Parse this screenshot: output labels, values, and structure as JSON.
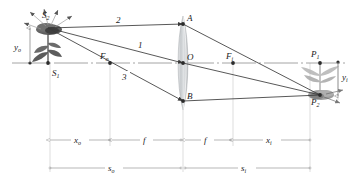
{
  "figure": {
    "type": "thin-lens-ray-diagram",
    "axis_y": 63,
    "lens_x": 183,
    "colors": {
      "line": "#3a3a3a",
      "axis": "#8d8d8d",
      "dimension": "#9a9a9a",
      "lens_glass": "#cfd2d4",
      "object": "#6f6f6f",
      "image": "#9a9a9a",
      "text": "#1a1a1a"
    }
  },
  "points": {
    "S1": {
      "label": "S",
      "sub": "1",
      "x": 48,
      "y": 63,
      "label_x": 52,
      "label_y": 75
    },
    "S2": {
      "label": "S",
      "sub": "2",
      "x": 48,
      "y": 28,
      "label_x": 44,
      "label_y": 17
    },
    "A": {
      "label": "A",
      "sub": "",
      "x": 183,
      "y": 24,
      "label_x": 187,
      "label_y": 21
    },
    "O": {
      "label": "O",
      "sub": "",
      "x": 183,
      "y": 63,
      "label_x": 187,
      "label_y": 60
    },
    "B": {
      "label": "B",
      "sub": "",
      "x": 183,
      "y": 101,
      "label_x": 187,
      "label_y": 99
    },
    "Fo": {
      "label": "F",
      "sub": "o",
      "x": 110,
      "y": 63,
      "label_x": 102,
      "label_y": 58
    },
    "Fi": {
      "label": "F",
      "sub": "i",
      "x": 233,
      "y": 63,
      "label_x": 228,
      "label_y": 58
    },
    "P1": {
      "label": "P",
      "sub": "1",
      "x": 320,
      "y": 63,
      "label_x": 313,
      "label_y": 57
    },
    "P2": {
      "label": "P",
      "sub": "2",
      "x": 320,
      "y": 95,
      "label_x": 313,
      "label_y": 104
    }
  },
  "rays": [
    {
      "name": "ray-2-parallel",
      "number": "2",
      "label_x": 118,
      "label_y": 22,
      "segments": [
        [
          48,
          28,
          183,
          24
        ],
        [
          183,
          24,
          320,
          95
        ]
      ]
    },
    {
      "name": "ray-1-through-center",
      "number": "1",
      "label_x": 139,
      "label_y": 47,
      "segments": [
        [
          48,
          28,
          183,
          63
        ],
        [
          183,
          63,
          320,
          95
        ]
      ]
    },
    {
      "name": "ray-3-through-focus",
      "number": "3",
      "label_x": 123,
      "label_y": 79,
      "segments": [
        [
          48,
          28,
          183,
          101
        ],
        [
          183,
          101,
          320,
          95
        ]
      ]
    }
  ],
  "heights": {
    "y_o": {
      "label": "y",
      "sub": "o",
      "x": 30,
      "top": 28,
      "bottom": 63,
      "label_x": 18,
      "label_y": 48
    },
    "y_i": {
      "label": "y",
      "sub": "i",
      "x": 338,
      "top": 62,
      "bottom": 95,
      "label_x": 344,
      "label_y": 80
    }
  },
  "dimensions_upper": [
    {
      "name": "x-o",
      "label": "x",
      "sub": "o",
      "x1": 50,
      "x2": 110,
      "y": 140
    },
    {
      "name": "f-object-side",
      "label": "f",
      "sub": "",
      "x1": 112,
      "x2": 181,
      "y": 140
    },
    {
      "name": "f-image-side",
      "label": "f",
      "sub": "",
      "x1": 185,
      "x2": 231,
      "y": 140
    },
    {
      "name": "x-i",
      "label": "x",
      "sub": "i",
      "x1": 233,
      "x2": 310,
      "y": 140
    }
  ],
  "dimensions_lower": [
    {
      "name": "s-o",
      "label": "s",
      "sub": "o",
      "x1": 50,
      "x2": 181,
      "y": 168
    },
    {
      "name": "s-i",
      "label": "s",
      "sub": "i",
      "x1": 185,
      "x2": 310,
      "y": 168
    }
  ],
  "guide_lines_x": [
    50,
    110,
    183,
    233,
    310
  ],
  "optical_axis": {
    "x1": 12,
    "x2": 348,
    "y": 63
  },
  "lens": {
    "cx": 183,
    "top": 16,
    "bottom": 110,
    "half_width": 6
  },
  "object_flower": {
    "name": "object-flower-upright",
    "base_x": 48,
    "base_y": 63,
    "head_y": 28
  },
  "image_flower": {
    "name": "image-flower-inverted",
    "base_x": 320,
    "base_y": 63,
    "head_y": 95
  }
}
